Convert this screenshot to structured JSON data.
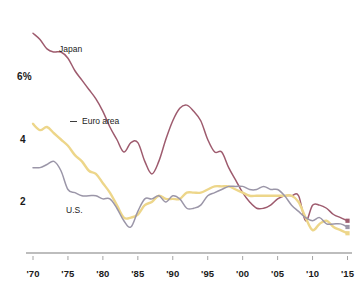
{
  "chart_data": {
    "type": "line",
    "title": "",
    "subtitle": "",
    "xlabel": "",
    "ylabel": "",
    "ylim": [
      0,
      7.2
    ],
    "xlim": [
      1970,
      2015.5
    ],
    "grid": false,
    "legend_position": "inline-annotations",
    "y_ticks": [
      "6%",
      "4",
      "2"
    ],
    "y_tick_values": [
      6,
      4,
      2
    ],
    "x_ticks": [
      "'70",
      "'75",
      "'80",
      "'85",
      "'90",
      "'95",
      "'00",
      "'05",
      "'10",
      "'15"
    ],
    "x_tick_values": [
      1970,
      1975,
      1980,
      1985,
      1990,
      1995,
      2000,
      2005,
      2010,
      2015
    ],
    "series": [
      {
        "name": "Japan",
        "color": "#9e5b6e",
        "end_marker": true,
        "x": [
          1970,
          1971,
          1972,
          1973,
          1974,
          1975,
          1976,
          1977,
          1978,
          1979,
          1980,
          1981,
          1982,
          1983,
          1984,
          1985,
          1986,
          1987,
          1988,
          1989,
          1990,
          1991,
          1992,
          1993,
          1994,
          1995,
          1996,
          1997,
          1998,
          1999,
          2000,
          2001,
          2002,
          2003,
          2004,
          2005,
          2006,
          2007,
          2008,
          2009,
          2010,
          2011,
          2012,
          2013,
          2014,
          2015
        ],
        "values": [
          7.4,
          7.2,
          6.9,
          6.8,
          6.8,
          6.6,
          6.2,
          5.9,
          5.6,
          5.3,
          4.9,
          4.4,
          4.0,
          3.6,
          3.9,
          3.9,
          3.3,
          2.9,
          3.3,
          4.0,
          4.6,
          5.0,
          5.1,
          4.9,
          4.6,
          4.0,
          3.6,
          3.6,
          3.1,
          2.7,
          2.3,
          2.0,
          1.8,
          1.8,
          1.9,
          2.1,
          2.2,
          2.2,
          2.2,
          1.4,
          1.9,
          1.9,
          1.8,
          1.6,
          1.5,
          1.4
        ]
      },
      {
        "name": "Euro area",
        "color": "#edd68a",
        "end_marker": true,
        "x": [
          1970,
          1971,
          1972,
          1973,
          1974,
          1975,
          1976,
          1977,
          1978,
          1979,
          1980,
          1981,
          1982,
          1983,
          1984,
          1985,
          1986,
          1987,
          1988,
          1989,
          1990,
          1991,
          1992,
          1993,
          1994,
          1995,
          1996,
          1997,
          1998,
          1999,
          2000,
          2001,
          2002,
          2003,
          2004,
          2005,
          2006,
          2007,
          2008,
          2009,
          2010,
          2011,
          2012,
          2013,
          2014,
          2015
        ],
        "values": [
          4.5,
          4.3,
          4.4,
          4.2,
          4.0,
          3.8,
          3.5,
          3.3,
          3.0,
          2.9,
          2.6,
          2.3,
          1.9,
          1.5,
          1.5,
          1.6,
          1.9,
          2.0,
          2.2,
          2.1,
          2.1,
          2.1,
          2.3,
          2.3,
          2.3,
          2.4,
          2.5,
          2.5,
          2.5,
          2.4,
          2.3,
          2.2,
          2.2,
          2.2,
          2.2,
          2.2,
          2.2,
          2.2,
          2.0,
          1.5,
          1.1,
          1.3,
          1.4,
          1.2,
          1.1,
          1.0
        ]
      },
      {
        "name": "U.S.",
        "color": "#9b96a8",
        "end_marker": true,
        "x": [
          1970,
          1971,
          1972,
          1973,
          1974,
          1975,
          1976,
          1977,
          1978,
          1979,
          1980,
          1981,
          1982,
          1983,
          1984,
          1985,
          1986,
          1987,
          1988,
          1989,
          1990,
          1991,
          1992,
          1993,
          1994,
          1995,
          1996,
          1997,
          1998,
          1999,
          2000,
          2001,
          2002,
          2003,
          2004,
          2005,
          2006,
          2007,
          2008,
          2009,
          2010,
          2011,
          2012,
          2013,
          2014,
          2015
        ],
        "values": [
          3.1,
          3.1,
          3.2,
          3.3,
          3.0,
          2.4,
          2.3,
          2.2,
          2.2,
          2.2,
          2.1,
          2.1,
          1.8,
          1.4,
          1.2,
          1.7,
          2.1,
          2.1,
          2.2,
          2.0,
          2.2,
          2.1,
          1.8,
          1.8,
          1.9,
          2.2,
          2.3,
          2.4,
          2.5,
          2.5,
          2.5,
          2.4,
          2.4,
          2.5,
          2.4,
          2.4,
          2.2,
          1.9,
          1.7,
          1.5,
          1.4,
          1.5,
          1.3,
          1.3,
          1.3,
          1.2
        ]
      }
    ],
    "annotations": [
      {
        "name": "japan-label",
        "text": "Japan",
        "x_px": 59,
        "y_px": 44
      },
      {
        "name": "euro-area-label",
        "text": "Euro area",
        "x_px": 82,
        "y_px": 116
      },
      {
        "name": "us-label",
        "text": "U.S.",
        "x_px": 66,
        "y_px": 205
      }
    ],
    "axis_color": "#bdbdbd"
  }
}
